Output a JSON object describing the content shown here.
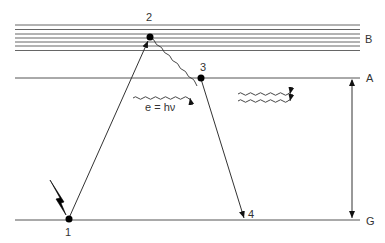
{
  "diagram": {
    "type": "energy-level-diagram",
    "colors": {
      "line": "#444444",
      "band": "#666666",
      "text": "#333333",
      "point": "#000000",
      "bolt": "#000000"
    },
    "levels": [
      {
        "id": "B",
        "label": "B",
        "kind": "band"
      },
      {
        "id": "A",
        "label": "A",
        "kind": "level"
      },
      {
        "id": "G",
        "label": "G",
        "kind": "ground"
      }
    ],
    "points": [
      {
        "id": "1",
        "label": "1"
      },
      {
        "id": "2",
        "label": "2"
      },
      {
        "id": "3",
        "label": "3"
      },
      {
        "id": "4",
        "label": "4"
      }
    ],
    "transitions": [
      {
        "from": "1",
        "to": "2",
        "style": "arrow",
        "meaning": "excitation"
      },
      {
        "from": "2",
        "to": "3",
        "style": "wavy",
        "meaning": "non-radiative relaxation"
      },
      {
        "from": "3",
        "to": "4",
        "style": "arrow",
        "meaning": "emission"
      }
    ],
    "equation": "e = hν",
    "excitation_symbol": "lightning-bolt",
    "emitted_photons": 2
  }
}
